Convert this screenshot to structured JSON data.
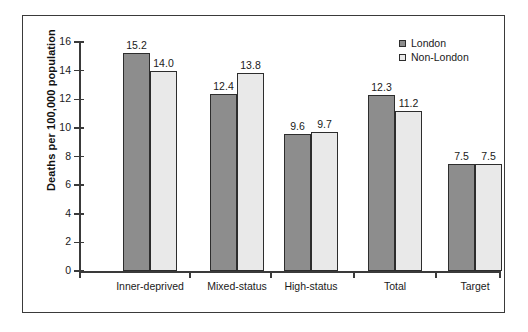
{
  "chart_data": {
    "type": "bar",
    "title": "",
    "subtitle": "",
    "xlabel": "",
    "ylabel": "Deaths per 100,000 population",
    "categories": [
      "Inner-deprived",
      "Mixed-status",
      "High-status",
      "Total",
      "Target"
    ],
    "series": [
      {
        "name": "London",
        "color": "#8d8d8d",
        "values": [
          15.2,
          12.4,
          9.6,
          12.3,
          7.5
        ]
      },
      {
        "name": "Non-London",
        "color": "#e9e9e9",
        "values": [
          14.0,
          13.8,
          9.7,
          11.2,
          7.5
        ]
      }
    ],
    "value_labels": {
      "London": [
        "15.2",
        "12.4",
        "9.6",
        "12.3",
        "7.5"
      ],
      "Non-London": [
        "14.0",
        "13.8",
        "9.7",
        "11.2",
        "7.5"
      ]
    },
    "ylim": [
      0,
      16
    ],
    "ytick_values": [
      0,
      2,
      4,
      6,
      8,
      10,
      12,
      14,
      16
    ],
    "ytick_labels": [
      "0",
      "2",
      "4",
      "6",
      "8",
      "10",
      "12",
      "14",
      "16"
    ],
    "grid": false,
    "legend_position": "top-right",
    "legend_entries": [
      "London",
      "Non-London"
    ]
  },
  "axis": {
    "y_title": "Deaths per 100,000 population"
  },
  "categories_display": [
    "Inner-deprived",
    "Mixed-status",
    "High-status",
    "Total",
    "Target"
  ],
  "legend": {
    "items": [
      {
        "label": "London"
      },
      {
        "label": "Non-London"
      }
    ]
  }
}
